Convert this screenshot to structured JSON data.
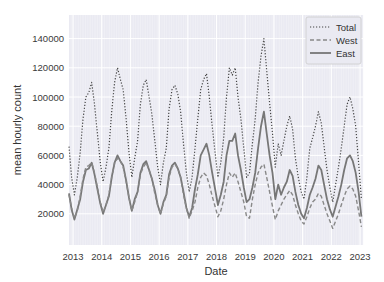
{
  "chart_data": {
    "type": "line",
    "title": "",
    "xlabel": "Date",
    "ylabel": "mean hourly count",
    "xlim": [
      2012.85,
      2023.1
    ],
    "ylim": [
      0,
      155000
    ],
    "grid": true,
    "legend_position": "upper right",
    "x_ticks": [
      "2013",
      "2014",
      "2015",
      "2016",
      "2017",
      "2018",
      "2019",
      "2020",
      "2021",
      "2022",
      "2023"
    ],
    "y_ticks": [
      "20000",
      "40000",
      "60000",
      "80000",
      "100000",
      "120000",
      "140000"
    ],
    "x": [
      2012.85,
      2012.95,
      2013.05,
      2013.15,
      2013.25,
      2013.35,
      2013.45,
      2013.55,
      2013.65,
      2013.75,
      2013.85,
      2013.95,
      2014.05,
      2014.15,
      2014.25,
      2014.35,
      2014.45,
      2014.55,
      2014.65,
      2014.75,
      2014.85,
      2014.95,
      2015.05,
      2015.15,
      2015.25,
      2015.35,
      2015.45,
      2015.55,
      2015.65,
      2015.75,
      2015.85,
      2015.95,
      2016.05,
      2016.15,
      2016.25,
      2016.35,
      2016.45,
      2016.55,
      2016.65,
      2016.75,
      2016.85,
      2016.95,
      2017.05,
      2017.15,
      2017.25,
      2017.35,
      2017.45,
      2017.55,
      2017.65,
      2017.75,
      2017.85,
      2017.95,
      2018.05,
      2018.15,
      2018.25,
      2018.35,
      2018.45,
      2018.55,
      2018.65,
      2018.75,
      2018.85,
      2018.95,
      2019.05,
      2019.15,
      2019.25,
      2019.35,
      2019.45,
      2019.55,
      2019.65,
      2019.75,
      2019.85,
      2019.95,
      2020.05,
      2020.15,
      2020.25,
      2020.35,
      2020.45,
      2020.55,
      2020.65,
      2020.75,
      2020.85,
      2020.95,
      2021.05,
      2021.15,
      2021.25,
      2021.35,
      2021.45,
      2021.55,
      2021.65,
      2021.75,
      2021.85,
      2021.95,
      2022.05,
      2022.15,
      2022.25,
      2022.35,
      2022.45,
      2022.55,
      2022.65,
      2022.75,
      2022.85,
      2022.95,
      2023.05
    ],
    "series": [
      {
        "name": "Total",
        "style": "dotted",
        "color": "#444444",
        "values": [
          66000,
          45000,
          33000,
          45000,
          62000,
          85000,
          100000,
          103000,
          110000,
          95000,
          75000,
          55000,
          42000,
          52000,
          65000,
          90000,
          110000,
          120000,
          112000,
          105000,
          85000,
          62000,
          45000,
          58000,
          70000,
          95000,
          108000,
          112000,
          100000,
          88000,
          70000,
          52000,
          40000,
          55000,
          65000,
          92000,
          105000,
          108000,
          102000,
          90000,
          68000,
          48000,
          35000,
          45000,
          65000,
          85000,
          105000,
          112000,
          116000,
          100000,
          80000,
          62000,
          45000,
          55000,
          72000,
          100000,
          120000,
          115000,
          120000,
          100000,
          85000,
          65000,
          45000,
          48000,
          68000,
          85000,
          110000,
          128000,
          140000,
          118000,
          96000,
          75000,
          52000,
          68000,
          60000,
          70000,
          80000,
          87000,
          78000,
          58000,
          45000,
          35000,
          30000,
          45000,
          65000,
          72000,
          80000,
          90000,
          82000,
          66000,
          50000,
          38000,
          28000,
          40000,
          52000,
          65000,
          80000,
          95000,
          100000,
          92000,
          80000,
          55000,
          30000
        ]
      },
      {
        "name": "West",
        "style": "dashed",
        "color": "#888888",
        "values": [
          33000,
          24000,
          17000,
          22000,
          32000,
          44000,
          52000,
          53000,
          55000,
          48000,
          38000,
          28000,
          21000,
          26000,
          33000,
          45000,
          55000,
          58000,
          56000,
          52000,
          42000,
          31000,
          22000,
          28000,
          35000,
          47000,
          52000,
          55000,
          50000,
          44000,
          34000,
          26000,
          20000,
          27000,
          32000,
          45000,
          52000,
          54000,
          51000,
          45000,
          33000,
          24000,
          17000,
          22000,
          28000,
          38000,
          45000,
          48000,
          46000,
          40000,
          32000,
          25000,
          18000,
          22000,
          30000,
          40000,
          48000,
          45000,
          48000,
          42000,
          35000,
          28000,
          18000,
          17000,
          30000,
          40000,
          48000,
          52000,
          54000,
          45000,
          35000,
          25000,
          16000,
          22000,
          26000,
          30000,
          33000,
          36000,
          33000,
          26000,
          20000,
          15000,
          13000,
          18000,
          24000,
          28000,
          30000,
          34000,
          32000,
          26000,
          20000,
          15000,
          10000,
          15000,
          20000,
          26000,
          32000,
          37000,
          39000,
          37000,
          32000,
          22000,
          11000
        ]
      },
      {
        "name": "East",
        "style": "solid",
        "color": "#777777",
        "values": [
          34000,
          23000,
          16000,
          23000,
          30000,
          42000,
          50000,
          51000,
          55000,
          47000,
          37000,
          27000,
          20000,
          26000,
          32000,
          45000,
          55000,
          60000,
          56000,
          53000,
          43000,
          31000,
          22000,
          30000,
          35000,
          48000,
          54000,
          56000,
          50000,
          44000,
          36000,
          26000,
          20000,
          28000,
          33000,
          47000,
          53000,
          55000,
          51000,
          45000,
          35000,
          24000,
          18000,
          24000,
          37000,
          47000,
          60000,
          64000,
          68000,
          60000,
          48000,
          37000,
          26000,
          33000,
          42000,
          60000,
          70000,
          70000,
          75000,
          60000,
          50000,
          38000,
          28000,
          30000,
          38000,
          48000,
          65000,
          80000,
          90000,
          75000,
          60000,
          48000,
          30000,
          40000,
          33000,
          38000,
          42000,
          50000,
          46000,
          35000,
          26000,
          20000,
          17000,
          24000,
          33000,
          38000,
          44000,
          53000,
          50000,
          40000,
          30000,
          23000,
          18000,
          25000,
          32000,
          40000,
          50000,
          58000,
          60000,
          56000,
          48000,
          35000,
          18000
        ]
      }
    ]
  },
  "legend": {
    "items": [
      {
        "label": "Total"
      },
      {
        "label": "West"
      },
      {
        "label": "East"
      }
    ]
  },
  "axes": {
    "xlabel": "Date",
    "ylabel": "mean hourly count"
  }
}
